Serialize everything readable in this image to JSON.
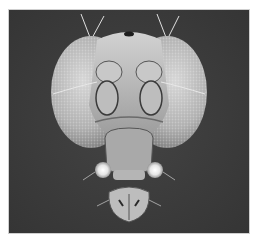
{
  "image": {
    "subject": "scanning electron micrograph of a fruit fly head (frontal view)",
    "style": "grayscale",
    "colors": {
      "background": "#3b3b3b",
      "border": "#cfcfcf",
      "eye_light": "#d8d8d8",
      "eye_dark": "#8a8a8a",
      "cuticle": "#b9b9b9",
      "highlight": "#f2f2f2"
    }
  }
}
